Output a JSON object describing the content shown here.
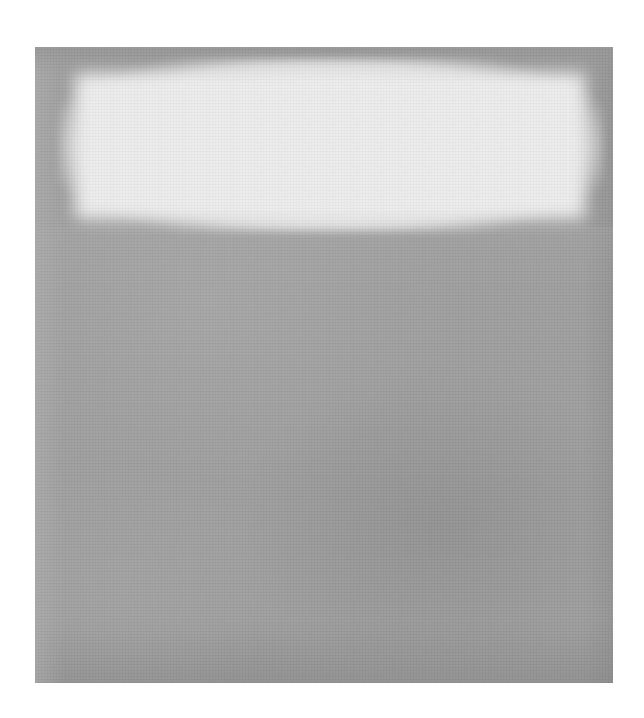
{
  "artwork": {
    "description": "Grayscale reproduction of a color-field abstract painting: a pale luminous horizontal rectangle across the upper portion above a large mid-gray field",
    "colors": {
      "page_background": "#ffffff",
      "field_gray": "#9e9e9e",
      "light_rectangle": "#ececec",
      "edge_gray": "#969696"
    },
    "regions": [
      {
        "name": "light-rectangle",
        "approx_bounds_px": {
          "x": 60,
          "y": 60,
          "w": 540,
          "h": 165
        }
      },
      {
        "name": "gray-field",
        "approx_bounds_px": {
          "x": 35,
          "y": 225,
          "w": 578,
          "h": 458
        }
      }
    ]
  }
}
